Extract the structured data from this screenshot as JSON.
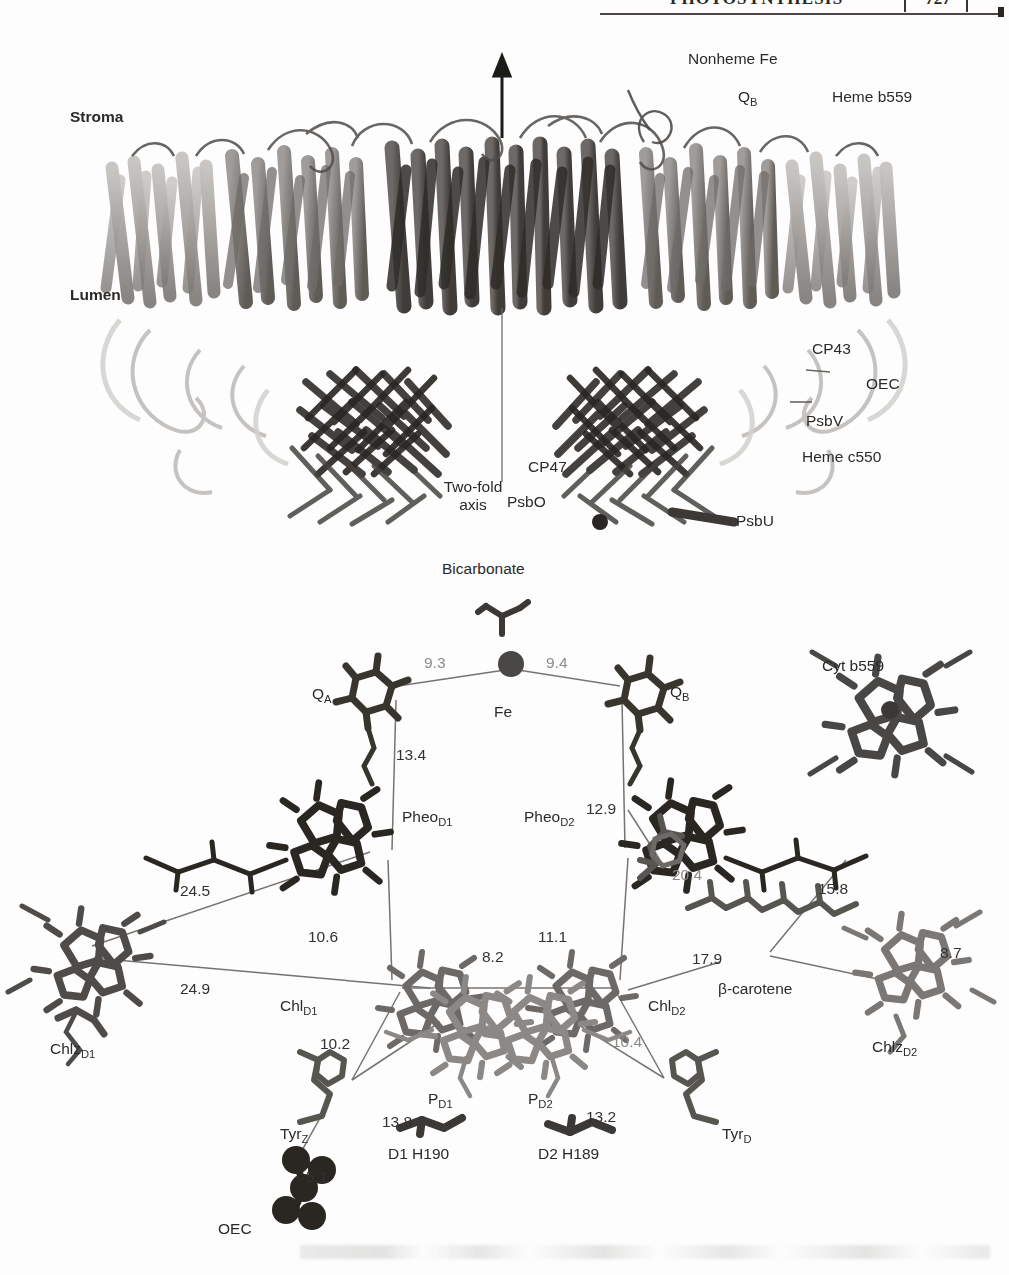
{
  "running_head": {
    "title": "PHOTOSYNTHESIS",
    "page_number": "727"
  },
  "figure": {
    "top_panel": {
      "name": "photosystem-II-dimer-structure",
      "labels": {
        "stroma": "Stroma",
        "lumen": "Lumen",
        "nonheme_fe": "Nonheme Fe",
        "q_b": "Q",
        "q_b_sub": "B",
        "heme_b559_pre": "Heme ",
        "heme_b559_ital": "b",
        "heme_b559_post": "559",
        "cp43": "CP43",
        "oec": "OEC",
        "psbv": "PsbV",
        "heme_c550_pre": "Heme ",
        "heme_c550_ital": "c",
        "heme_c550_post": "550",
        "cp47": "CP47",
        "psbo": "PsbO",
        "psbu": "PsbU",
        "two_fold_axis_line1": "Two-fold",
        "two_fold_axis_line2": "axis"
      }
    },
    "bottom_panel": {
      "name": "reaction-center-cofactor-arrangement",
      "labels": {
        "bicarbonate": "Bicarbonate",
        "q_a": "Q",
        "q_a_sub": "A",
        "fe": "Fe",
        "q_b": "Q",
        "q_b_sub": "B",
        "cyt_b559_pre": "Cyt ",
        "cyt_b559_ital": "b",
        "cyt_b559_post": "559",
        "pheo_d1": "Pheo",
        "pheo_d1_sub": "D1",
        "pheo_d2": "Pheo",
        "pheo_d2_sub": "D2",
        "chl_d1": "Chl",
        "chl_d1_sub": "D1",
        "chl_d2": "Chl",
        "chl_d2_sub": "D2",
        "chlz_d1": "Chlz",
        "chlz_d1_sub": "D1",
        "chlz_d2": "Chlz",
        "chlz_d2_sub": "D2",
        "beta_carotene": "β-carotene",
        "p_d1": "P",
        "p_d1_sub": "D1",
        "p_d2": "P",
        "p_d2_sub": "D2",
        "tyr_z": "Tyr",
        "tyr_z_sub": "Z",
        "tyr_d": "Tyr",
        "tyr_d_sub": "D",
        "d1_h190": "D1 H190",
        "d2_h189": "D2 H189",
        "oec": "OEC"
      },
      "distances": [
        {
          "id": "qa-fe",
          "value": "9.3",
          "faint": true
        },
        {
          "id": "fe-qb",
          "value": "9.4",
          "faint": true
        },
        {
          "id": "qa-pheod1",
          "value": "13.4",
          "faint": false
        },
        {
          "id": "qb-pheod2",
          "value": "12.9",
          "faint": false
        },
        {
          "id": "chlzd1-pheod1",
          "value": "24.5",
          "faint": false
        },
        {
          "id": "chlzd1-chld1",
          "value": "24.9",
          "faint": false
        },
        {
          "id": "pheod1-chld1",
          "value": "10.6",
          "faint": false
        },
        {
          "id": "pheod2-chld2",
          "value": "11.1",
          "faint": false
        },
        {
          "id": "chld1-chld2",
          "value": "8.2",
          "faint": false
        },
        {
          "id": "qb-carotene",
          "value": "20.4",
          "faint": true
        },
        {
          "id": "carotene-cyt",
          "value": "15.8",
          "faint": false
        },
        {
          "id": "chld2-carotene",
          "value": "17.9",
          "faint": false
        },
        {
          "id": "chlzd2-inner",
          "value": "8.7",
          "faint": false
        },
        {
          "id": "chld1-pd1",
          "value": "10.2",
          "faint": false
        },
        {
          "id": "chld2-pd2",
          "value": "10.4",
          "faint": true
        },
        {
          "id": "pd1-tyrz",
          "value": "13.8",
          "faint": false
        },
        {
          "id": "pd2-tyrd",
          "value": "13.2",
          "faint": false
        },
        {
          "id": "tyrz-oec",
          "value": "5.1",
          "faint": false
        }
      ]
    }
  },
  "colors": {
    "ink": "#2c2a28",
    "faint_ink": "#8d8a87",
    "paper": "#fdfdfd",
    "structure_dark": "#4a4744",
    "structure_mid": "#8b8885",
    "structure_light": "#c2bfbc"
  }
}
